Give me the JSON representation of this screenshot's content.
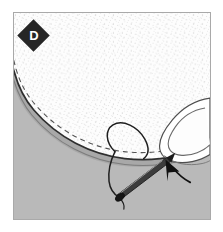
{
  "figure": {
    "step_label": "D",
    "title": "Hand-sewing an opening closed with a slip stitch",
    "caption": "",
    "colors": {
      "background": "#ffffff",
      "frame_border": "#a9a9a9",
      "surface_gray": "#b9b9b9",
      "fabric_white": "#fdfdfd",
      "fabric_stipple": "#b6b6b6",
      "outline_dark": "#2b2b2b",
      "outline_mid": "#5a5a5a",
      "thread": "#1f1f1f",
      "needle_body": "#3a3a3a",
      "badge_fill": "#262626",
      "badge_text": "#ffffff",
      "arrow": "#111111",
      "shadow_gray": "#8f8f8f"
    },
    "frame": {
      "x": 13,
      "y": 12,
      "width": 198,
      "height": 208
    },
    "elements": [
      {
        "name": "step-badge",
        "label": "D",
        "shape": "diamond"
      },
      {
        "name": "fabric-panel",
        "label": "Stippled white fabric panel with curved hemmed edge"
      },
      {
        "name": "fabric-folded-edge",
        "label": "Dark curved fold line along fabric edge"
      },
      {
        "name": "stitch-dashed-line",
        "label": "Dashed seam guideline parallel to fold"
      },
      {
        "name": "thread-loop",
        "label": "Loop of thread rising from the seam"
      },
      {
        "name": "thread-tail",
        "label": "Thread tail running down to needle eye"
      },
      {
        "name": "needle",
        "label": "Sewing needle angled down-left"
      },
      {
        "name": "fingertip",
        "label": "Fingertip with fingernail holding fabric at right"
      },
      {
        "name": "pointer-arrow",
        "label": "Arrow pointing to stitch entry point"
      },
      {
        "name": "work-surface",
        "label": "Gray work surface behind the fabric"
      }
    ]
  }
}
